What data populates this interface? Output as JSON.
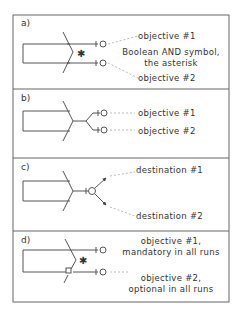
{
  "panels": [
    {
      "letter": "a)",
      "labels": {
        "top": "objective #1",
        "middle1": "Boolean AND symbol,",
        "middle2": "the asterisk",
        "bottom": "objective #2"
      },
      "symbol": "asterisk"
    },
    {
      "letter": "b)",
      "labels": {
        "top": "objective #1",
        "bottom": "objective #2"
      }
    },
    {
      "letter": "c)",
      "labels": {
        "top": "destination #1",
        "bottom": "destination #2"
      }
    },
    {
      "letter": "d)",
      "labels": {
        "top1": "objective #1,",
        "top2": "mandatory in all runs",
        "bottom1": "objective #2,",
        "bottom2": "optional in all runs"
      },
      "symbol": "asterisk"
    }
  ],
  "colors": {
    "line": "#555555",
    "border": "#666666",
    "text": "#333333",
    "dashed": "#bbbbbb"
  }
}
